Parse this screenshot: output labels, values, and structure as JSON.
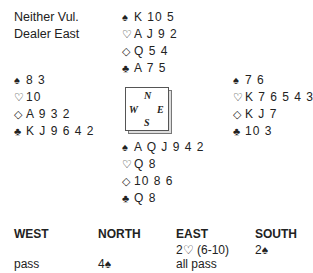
{
  "info": {
    "vulnerability": "Neither Vul.",
    "dealer": "Dealer East"
  },
  "suit_symbols": {
    "spades": "♠",
    "hearts": "♡",
    "diamonds": "◇",
    "clubs": "♣"
  },
  "hands": {
    "north": {
      "spades": "K 10 5",
      "hearts": "A J 9 2",
      "diamonds": "Q 5 4",
      "clubs": "A 7 5"
    },
    "west": {
      "spades": "8 3",
      "hearts": "10",
      "diamonds": "A 9 3 2",
      "clubs": "K J 9 6 4 2"
    },
    "east": {
      "spades": "7 6",
      "hearts": "K 7 6 5 4 3",
      "diamonds": "K J 7",
      "clubs": "10 3"
    },
    "south": {
      "spades": "A Q J 9 4 2",
      "hearts": "Q 8",
      "diamonds": "10 8 6",
      "clubs": "Q 8"
    }
  },
  "compass": {
    "n": "N",
    "e": "E",
    "s": "S",
    "w": "W"
  },
  "auction": {
    "headers": [
      "WEST",
      "NORTH",
      "EAST",
      "SOUTH"
    ],
    "rows": [
      [
        "",
        "",
        "2♡ (6-10)",
        "2♠"
      ],
      [
        "pass",
        "4♠",
        "all pass",
        ""
      ]
    ]
  }
}
